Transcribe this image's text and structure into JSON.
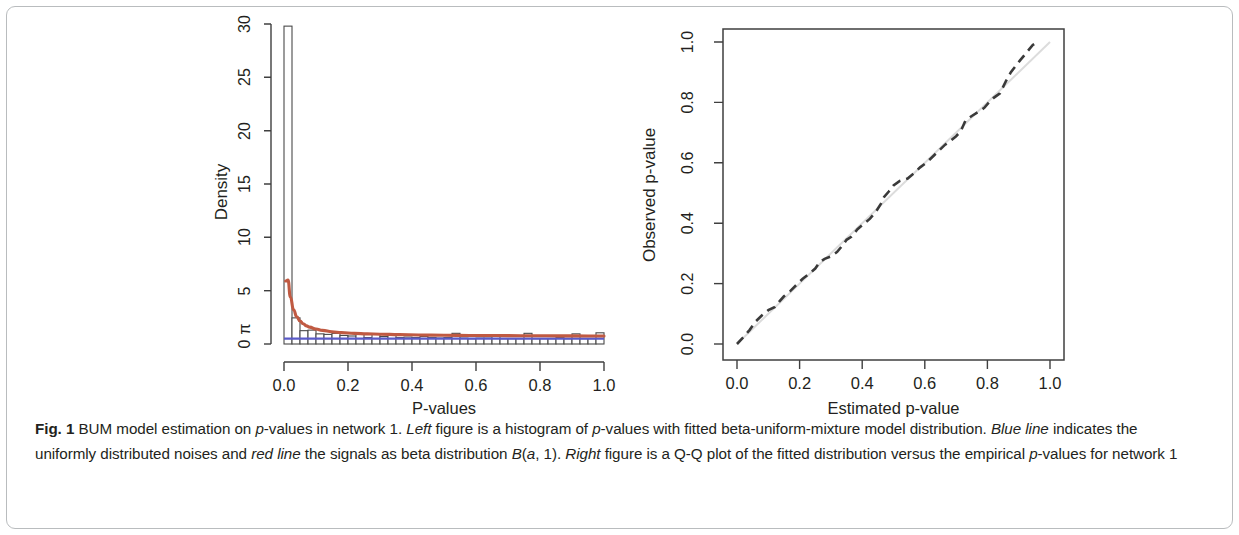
{
  "figure": {
    "label": "Fig. 1",
    "caption_parts": [
      {
        "text": "Fig. 1 ",
        "style": "bold"
      },
      {
        "text": "BUM model estimation on ",
        "style": "normal"
      },
      {
        "text": "p",
        "style": "italic"
      },
      {
        "text": "-values in network 1. ",
        "style": "normal"
      },
      {
        "text": "Left ",
        "style": "italic"
      },
      {
        "text": "figure is a histogram of ",
        "style": "normal"
      },
      {
        "text": "p",
        "style": "italic"
      },
      {
        "text": "-values with fitted beta-uniform-mixture model distribution. ",
        "style": "normal"
      },
      {
        "text": "Blue line ",
        "style": "italic"
      },
      {
        "text": "indicates the uniformly distributed noises and ",
        "style": "normal"
      },
      {
        "text": "red line ",
        "style": "italic"
      },
      {
        "text": "the signals as beta distribution ",
        "style": "normal"
      },
      {
        "text": "B",
        "style": "italic"
      },
      {
        "text": "(",
        "style": "normal"
      },
      {
        "text": "a",
        "style": "italic"
      },
      {
        "text": ", 1). ",
        "style": "normal"
      },
      {
        "text": "Right ",
        "style": "italic"
      },
      {
        "text": "figure is a Q-Q plot of the fitted distribution versus the empirical ",
        "style": "normal"
      },
      {
        "text": "p",
        "style": "italic"
      },
      {
        "text": "-values for network 1",
        "style": "normal"
      }
    ],
    "caption_plain": "Fig. 1 BUM model estimation on p-values in network 1. Left figure is a histogram of p-values with fitted beta-uniform-mixture model distribution. Blue line indicates the uniformly distributed noises and red line the signals as beta distribution B(a, 1). Right figure is a Q-Q plot of the fitted distribution versus the empirical p-values for network 1"
  },
  "chart_data": [
    {
      "panel": "left",
      "type": "bar",
      "title": "",
      "xlabel": "P-values",
      "ylabel": "Density",
      "xlim": [
        0.0,
        1.0
      ],
      "ylim": [
        0.0,
        30.0
      ],
      "xticks": [
        "0.0",
        "0.2",
        "0.4",
        "0.6",
        "0.8",
        "1.0"
      ],
      "xtick_values": [
        0.0,
        0.2,
        0.4,
        0.6,
        0.8,
        1.0
      ],
      "yticks": [
        "0",
        "5",
        "10",
        "15",
        "20",
        "25",
        "30"
      ],
      "ytick_values": [
        0,
        5,
        10,
        15,
        20,
        25,
        30
      ],
      "extra_ytick_label": "π",
      "extra_ytick_value": 1.1,
      "grid": false,
      "legend": null,
      "bin_width": 0.025,
      "categories": [
        0.0125,
        0.0375,
        0.0625,
        0.0875,
        0.1125,
        0.1375,
        0.1625,
        0.1875,
        0.2125,
        0.2375,
        0.2625,
        0.2875,
        0.3125,
        0.3375,
        0.3625,
        0.3875,
        0.4125,
        0.4375,
        0.4625,
        0.4875,
        0.5125,
        0.5375,
        0.5625,
        0.5875,
        0.6125,
        0.6375,
        0.6625,
        0.6875,
        0.7125,
        0.7375,
        0.7625,
        0.7875,
        0.8125,
        0.8375,
        0.8625,
        0.8875,
        0.9125,
        0.9375,
        0.9625,
        0.9875
      ],
      "values": [
        29.8,
        2.45,
        1.25,
        1.3,
        0.95,
        0.9,
        1.0,
        0.8,
        0.75,
        0.95,
        0.6,
        0.9,
        0.7,
        0.95,
        0.6,
        0.65,
        0.6,
        0.7,
        0.6,
        0.55,
        0.6,
        1.0,
        0.55,
        0.5,
        0.55,
        0.55,
        0.85,
        0.5,
        0.5,
        0.5,
        1.0,
        0.5,
        0.5,
        0.5,
        0.6,
        0.5,
        0.95,
        0.5,
        0.5,
        1.05
      ],
      "series": [
        {
          "name": "fitted beta-uniform-mixture (red line)",
          "color": "#c05a42",
          "type": "line",
          "x": [
            0.005,
            0.0125,
            0.02,
            0.03,
            0.04,
            0.05,
            0.06,
            0.07,
            0.08,
            0.1,
            0.12,
            0.15,
            0.18,
            0.22,
            0.26,
            0.3,
            0.36,
            0.42,
            0.5,
            0.58,
            0.66,
            0.74,
            0.82,
            0.9,
            1.0
          ],
          "y": [
            5.9,
            6.0,
            4.4,
            3.2,
            2.55,
            2.15,
            1.9,
            1.7,
            1.58,
            1.4,
            1.28,
            1.15,
            1.07,
            1.0,
            0.95,
            0.92,
            0.88,
            0.85,
            0.82,
            0.8,
            0.79,
            0.78,
            0.77,
            0.76,
            0.75
          ]
        },
        {
          "name": "uniform noise component (blue line)",
          "color": "#5a5ac8",
          "type": "line",
          "x": [
            0.0,
            1.0
          ],
          "y": [
            0.5,
            0.5
          ]
        }
      ]
    },
    {
      "panel": "right",
      "type": "line",
      "title": "",
      "xlabel": "Estimated p-value",
      "ylabel": "Observed p-value",
      "xlim": [
        0.0,
        1.0
      ],
      "ylim": [
        0.0,
        1.0
      ],
      "xticks": [
        "0.0",
        "0.2",
        "0.4",
        "0.6",
        "0.8",
        "1.0"
      ],
      "xtick_values": [
        0.0,
        0.2,
        0.4,
        0.6,
        0.8,
        1.0
      ],
      "yticks": [
        "0.0",
        "0.2",
        "0.4",
        "0.6",
        "0.8",
        "1.0"
      ],
      "ytick_values": [
        0.0,
        0.2,
        0.4,
        0.6,
        0.8,
        1.0
      ],
      "grid": false,
      "box": true,
      "legend": null,
      "series": [
        {
          "name": "Q-Q empirical vs fitted (dashed line)",
          "color": "#3a3a3a",
          "type": "line",
          "dash": true,
          "x": [
            0.0,
            0.02,
            0.04,
            0.06,
            0.08,
            0.1,
            0.12,
            0.135,
            0.15,
            0.17,
            0.19,
            0.21,
            0.23,
            0.25,
            0.265,
            0.28,
            0.3,
            0.32,
            0.34,
            0.35,
            0.365,
            0.385,
            0.405,
            0.425,
            0.445,
            0.46,
            0.47,
            0.485,
            0.5,
            0.52,
            0.545,
            0.565,
            0.585,
            0.605,
            0.625,
            0.645,
            0.665,
            0.685,
            0.7,
            0.715,
            0.73,
            0.75,
            0.77,
            0.79,
            0.805,
            0.82,
            0.84,
            0.86,
            0.875,
            0.89,
            0.905,
            0.925,
            0.945,
            0.96
          ],
          "y": [
            0.0,
            0.022,
            0.046,
            0.075,
            0.095,
            0.112,
            0.122,
            0.14,
            0.158,
            0.175,
            0.196,
            0.216,
            0.232,
            0.25,
            0.272,
            0.282,
            0.29,
            0.305,
            0.33,
            0.345,
            0.355,
            0.38,
            0.398,
            0.415,
            0.44,
            0.465,
            0.487,
            0.505,
            0.525,
            0.54,
            0.548,
            0.565,
            0.585,
            0.6,
            0.62,
            0.64,
            0.66,
            0.675,
            0.688,
            0.705,
            0.74,
            0.755,
            0.768,
            0.782,
            0.8,
            0.815,
            0.83,
            0.872,
            0.9,
            0.92,
            0.94,
            0.965,
            0.99,
            1.0
          ]
        },
        {
          "name": "reference line y = x",
          "color": "#dcdcdc",
          "type": "line",
          "x": [
            0.0,
            1.0
          ],
          "y": [
            0.0,
            1.0
          ]
        }
      ]
    }
  ],
  "colors": {
    "red_line": "#c05a42",
    "blue_line": "#5a5ac8",
    "axis": "#3f3f3f",
    "reference_line": "#dcdcdc",
    "text": "#231f20",
    "card_border": "#b9bcbe"
  }
}
